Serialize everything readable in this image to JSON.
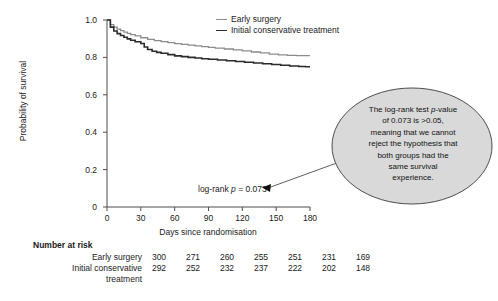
{
  "chart_data": {
    "type": "line",
    "title": "",
    "xlabel": "Days since randomisation",
    "ylabel": "Probability of survival",
    "xlim": [
      0,
      180
    ],
    "ylim": [
      0,
      1.0
    ],
    "xticks": [
      "0",
      "30",
      "60",
      "90",
      "120",
      "150",
      "180"
    ],
    "yticks": [
      "0",
      "0.2",
      "0.4",
      "0.6",
      "0.8",
      "1.0"
    ],
    "grid": false,
    "legend_position": "top-right",
    "series": [
      {
        "name": "Early surgery",
        "color": "#8c8c8c",
        "x": [
          0,
          3,
          6,
          9,
          12,
          15,
          18,
          21,
          25,
          30,
          36,
          42,
          48,
          54,
          60,
          66,
          72,
          78,
          84,
          90,
          96,
          104,
          112,
          120,
          128,
          136,
          144,
          152,
          160,
          168,
          175,
          180
        ],
        "y": [
          1.0,
          0.975,
          0.962,
          0.951,
          0.943,
          0.935,
          0.928,
          0.922,
          0.915,
          0.905,
          0.896,
          0.89,
          0.884,
          0.879,
          0.874,
          0.87,
          0.866,
          0.862,
          0.858,
          0.854,
          0.85,
          0.845,
          0.84,
          0.835,
          0.829,
          0.824,
          0.818,
          0.813,
          0.811,
          0.81,
          0.81,
          0.81
        ]
      },
      {
        "name": "Initial conservative treatment",
        "color": "#2b2b2b",
        "x": [
          0,
          3,
          6,
          9,
          12,
          15,
          18,
          21,
          25,
          30,
          33,
          36,
          40,
          44,
          48,
          54,
          60,
          66,
          72,
          78,
          84,
          90,
          98,
          106,
          114,
          122,
          130,
          138,
          146,
          154,
          162,
          170,
          176,
          180
        ],
        "y": [
          1.0,
          0.962,
          0.941,
          0.927,
          0.917,
          0.908,
          0.899,
          0.892,
          0.884,
          0.874,
          0.856,
          0.842,
          0.833,
          0.827,
          0.822,
          0.815,
          0.808,
          0.804,
          0.8,
          0.797,
          0.793,
          0.79,
          0.786,
          0.782,
          0.778,
          0.774,
          0.77,
          0.766,
          0.762,
          0.758,
          0.754,
          0.751,
          0.75,
          0.75
        ]
      }
    ],
    "annotations": [
      {
        "text_prefix": "log-rank ",
        "text_italic": "p",
        "text_suffix": " = 0.073"
      }
    ]
  },
  "legend": {
    "items": [
      {
        "label": "Early surgery",
        "color": "#8c8c8c"
      },
      {
        "label": "Initial conservative treatment",
        "color": "#2b2b2b"
      }
    ]
  },
  "logrank": {
    "prefix": "log-rank ",
    "italic": "p",
    "suffix": " = 0.073"
  },
  "callout": {
    "line1_a": "The log-rank test ",
    "line1_i": "p",
    "line1_b": "-value",
    "line2": "of 0.073 is >0.05,",
    "line3": "meaning that we cannot",
    "line4": "reject the hypothesis that",
    "line5": "both groups had the",
    "line6": "same survival",
    "line7": "experience.",
    "fill_color": "#d9d9d9",
    "stroke_color": "#4d4d4d"
  },
  "risk_table": {
    "title": "Number at risk",
    "rows": [
      {
        "label": "Early surgery",
        "label2": "",
        "values": [
          "300",
          "271",
          "260",
          "255",
          "251",
          "231",
          "169"
        ]
      },
      {
        "label": "Initial conservative",
        "label2": "treatment",
        "values": [
          "292",
          "252",
          "232",
          "237",
          "222",
          "202",
          "148"
        ]
      }
    ]
  }
}
